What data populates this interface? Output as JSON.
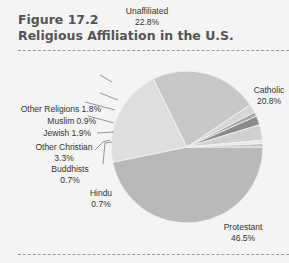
{
  "figure": {
    "number": "Figure 17.2",
    "title": "Religious Affiliation in the U.S."
  },
  "chart_data": {
    "type": "pie",
    "title": "Religious Affiliation in the U.S.",
    "categories": [
      "Protestant",
      "Catholic",
      "Unaffiliated",
      "Other Religions",
      "Muslim",
      "Jewish",
      "Other Christian",
      "Buddhists",
      "Hindu"
    ],
    "values": [
      46.5,
      20.8,
      22.8,
      1.8,
      0.9,
      1.9,
      3.3,
      0.7,
      0.7
    ],
    "labels": [
      "Protestant 46.5%",
      "Catholic 20.8%",
      "Unaffiliated 22.8%",
      "Other Religions 1.8%",
      "Muslim 0.9%",
      "Jewish 1.9%",
      "Other Christian 3.3%",
      "Buddhists 0.7%",
      "Hindu 0.7%"
    ]
  },
  "labels": {
    "unaffiliated": {
      "name": "Unaffiliated",
      "pct": "22.8%"
    },
    "catholic": {
      "name": "Catholic",
      "pct": "20.8%"
    },
    "other_religions": "Other Religions 1.8%",
    "muslim": "Muslim 0.9%",
    "jewish": "Jewish 1.9%",
    "other_christian": {
      "name": "Other Christian",
      "pct": "3.3%"
    },
    "buddhists": {
      "name": "Buddhists",
      "pct": "0.7%"
    },
    "hindu": {
      "name": "Hindu",
      "pct": "0.7%"
    },
    "protestant": {
      "name": "Protestant",
      "pct": "46.5%"
    }
  }
}
